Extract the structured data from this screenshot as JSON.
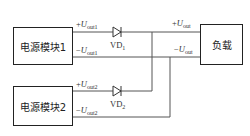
{
  "modules": [
    {
      "id": "module1",
      "label": "电源模块1",
      "plus_sign": "+",
      "plus_var": "U",
      "plus_sub": "out1",
      "minus_sign": "−",
      "minus_var": "U",
      "minus_sub": "out1"
    },
    {
      "id": "module2",
      "label": "电源模块2",
      "plus_sign": "+",
      "plus_var": "U",
      "plus_sub": "out2",
      "minus_sign": "−",
      "minus_var": "U",
      "minus_sub": "out2"
    }
  ],
  "diodes": [
    {
      "name": "VD",
      "sub": "1"
    },
    {
      "name": "VD",
      "sub": "2"
    }
  ],
  "load": {
    "label": "负载",
    "plus_sign": "+",
    "plus_var": "U",
    "plus_sub": "out",
    "minus_sign": "−",
    "minus_var": "U",
    "minus_sub": "out"
  },
  "colors": {
    "line": "#444444",
    "text": "#222222"
  }
}
